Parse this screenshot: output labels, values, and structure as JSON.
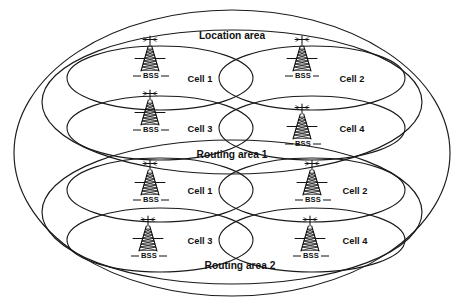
{
  "figure": {
    "title": "Location area",
    "type": "network-coverage-diagram",
    "background_color": "#ffffff",
    "line_color": "#1a1a1a"
  },
  "areas": {
    "location_area_label": "Location area",
    "routing_area_1_label": "Routing area 1",
    "routing_area_2_label": "Routing area 2"
  },
  "cells": [
    {
      "id": "ra1-cell1",
      "label": "Cell 1",
      "bss": "BSS",
      "area": "Routing area 1",
      "position": "top-left"
    },
    {
      "id": "ra1-cell2",
      "label": "Cell 2",
      "bss": "BSS",
      "area": "Routing area 1",
      "position": "top-right"
    },
    {
      "id": "ra1-cell3",
      "label": "Cell 3",
      "bss": "BSS",
      "area": "Routing area 1",
      "position": "bottom-left"
    },
    {
      "id": "ra1-cell4",
      "label": "Cell 4",
      "bss": "BSS",
      "area": "Routing area 1",
      "position": "bottom-right"
    },
    {
      "id": "ra2-cell1",
      "label": "Cell 1",
      "bss": "BSS",
      "area": "Routing area 2",
      "position": "top-left"
    },
    {
      "id": "ra2-cell2",
      "label": "Cell 2",
      "bss": "BSS",
      "area": "Routing area 2",
      "position": "top-right"
    },
    {
      "id": "ra2-cell3",
      "label": "Cell 3",
      "bss": "BSS",
      "area": "Routing area 2",
      "position": "bottom-left"
    },
    {
      "id": "ra2-cell4",
      "label": "Cell 4",
      "bss": "BSS",
      "area": "Routing area 2",
      "position": "bottom-right"
    }
  ],
  "icons": {
    "tower": "radio-tower-icon",
    "tower_count": 8
  }
}
